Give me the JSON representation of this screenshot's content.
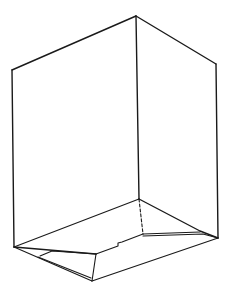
{
  "diagram": {
    "subject": "box-line-drawing",
    "stroke_color": "#1a1a1a",
    "background_color": "#ffffff",
    "vertices": {
      "apex": [
        136,
        16
      ],
      "top_left": [
        12,
        70
      ],
      "top_right": [
        216,
        64
      ],
      "inner_front_top": [
        139,
        199
      ],
      "left_bottom": [
        14,
        247
      ],
      "right_bottom": [
        218,
        238
      ],
      "front_bottom": [
        92,
        281
      ],
      "inner_left_fold": [
        96,
        254
      ],
      "inner_right_fold": [
        143,
        234
      ],
      "right_flap_tip": [
        203,
        236
      ],
      "notch": [
        120,
        243
      ]
    }
  }
}
